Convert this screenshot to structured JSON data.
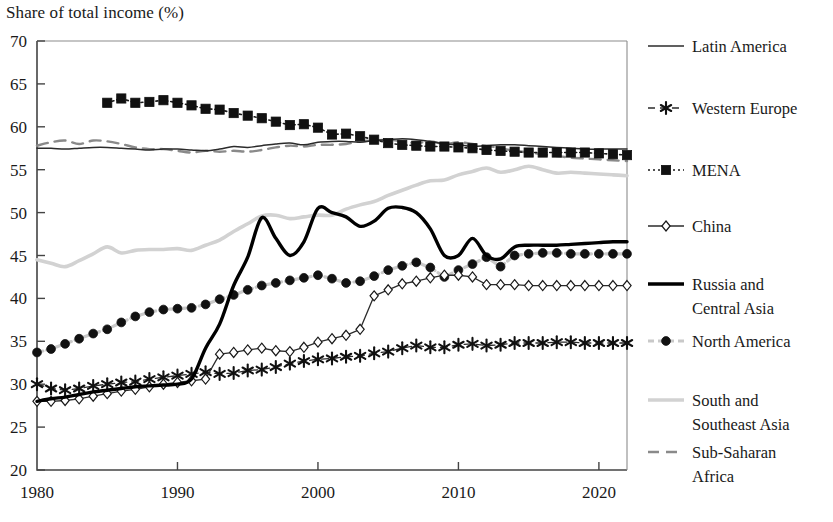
{
  "title": "Share of total income (%)",
  "axes": {
    "y_label": "Share of total income (%)",
    "y_ticks": [
      "70",
      "65",
      "60",
      "55",
      "50",
      "45",
      "40",
      "35",
      "30",
      "25",
      "20"
    ],
    "x_ticks": [
      "1980",
      "1990",
      "2000",
      "2010",
      "2020"
    ],
    "ylim": [
      20,
      70
    ],
    "xlim": [
      1980,
      2022
    ]
  },
  "legend": {
    "position": "right",
    "items": [
      {
        "label": "Latin America",
        "key": "latin_america",
        "style": "solid-thin",
        "color": "#2b2b2b",
        "marker": "none"
      },
      {
        "label": "Western Europe",
        "key": "western_europe",
        "style": "dashed",
        "color": "#2b2b2b",
        "marker": "star"
      },
      {
        "label": "MENA",
        "key": "mena",
        "style": "dotted",
        "color": "#1a1a1a",
        "marker": "square"
      },
      {
        "label": "China",
        "key": "china",
        "style": "solid-thin",
        "color": "#2b2b2b",
        "marker": "diamond-open"
      },
      {
        "label": "Russia and Central Asia",
        "key": "russia_central_asia",
        "style": "solid-thick",
        "color": "#000000",
        "marker": "none"
      },
      {
        "label": "North America",
        "key": "north_america",
        "style": "dashed-gray",
        "color": "#c8c8c8",
        "marker": "circle"
      },
      {
        "label": "South and Southeast Asia",
        "key": "south_southeast_asia",
        "style": "solid-thick-gray",
        "color": "#d2d2d2",
        "marker": "none"
      },
      {
        "label": "Sub-Saharan Africa",
        "key": "sub_saharan_africa",
        "style": "dashed-mid",
        "color": "#8a8a8a",
        "marker": "none"
      }
    ]
  },
  "chart_data": {
    "type": "line",
    "title": "Share of total income (%)",
    "xlabel": "",
    "ylabel": "Share of total income (%)",
    "xlim": [
      1980,
      2022
    ],
    "ylim": [
      20,
      70
    ],
    "grid": false,
    "legend_position": "right",
    "x": [
      1980,
      1981,
      1982,
      1983,
      1984,
      1985,
      1986,
      1987,
      1988,
      1989,
      1990,
      1991,
      1992,
      1993,
      1994,
      1995,
      1996,
      1997,
      1998,
      1999,
      2000,
      2001,
      2002,
      2003,
      2004,
      2005,
      2006,
      2007,
      2008,
      2009,
      2010,
      2011,
      2012,
      2013,
      2014,
      2015,
      2016,
      2017,
      2018,
      2019,
      2020,
      2021,
      2022
    ],
    "series": [
      {
        "name": "Latin America",
        "values": [
          57.5,
          57.5,
          57.4,
          57.5,
          57.6,
          57.6,
          57.5,
          57.4,
          57.3,
          57.4,
          57.4,
          57.3,
          57.2,
          57.4,
          57.7,
          57.6,
          57.8,
          58.0,
          58.1,
          57.9,
          58.2,
          58.3,
          58.3,
          58.2,
          58.4,
          58.5,
          58.6,
          58.5,
          58.3,
          58.0,
          57.9,
          57.7,
          57.8,
          57.9,
          57.9,
          57.8,
          57.7,
          57.6,
          57.5,
          57.4,
          57.4,
          57.4,
          57.4
        ]
      },
      {
        "name": "Western Europe",
        "values": [
          30.0,
          29.5,
          29.3,
          29.5,
          29.8,
          30.0,
          30.2,
          30.3,
          30.6,
          30.8,
          31.0,
          31.2,
          31.4,
          31.2,
          31.3,
          31.6,
          31.7,
          32.0,
          32.4,
          32.7,
          32.9,
          33.0,
          33.2,
          33.3,
          33.6,
          33.8,
          34.2,
          34.5,
          34.3,
          34.3,
          34.6,
          34.7,
          34.5,
          34.6,
          34.8,
          34.8,
          34.8,
          34.9,
          34.9,
          34.8,
          34.8,
          34.8,
          34.8
        ]
      },
      {
        "name": "MENA",
        "values": [
          null,
          null,
          null,
          null,
          null,
          62.8,
          63.3,
          62.8,
          62.9,
          63.1,
          62.8,
          62.5,
          62.1,
          62.0,
          61.6,
          61.3,
          61.0,
          60.6,
          60.2,
          60.3,
          59.9,
          59.1,
          59.2,
          58.9,
          58.5,
          58.1,
          57.9,
          57.8,
          57.7,
          57.7,
          57.6,
          57.5,
          57.3,
          57.2,
          57.1,
          57.0,
          57.0,
          57.0,
          57.0,
          57.0,
          56.9,
          56.8,
          56.7
        ]
      },
      {
        "name": "China",
        "values": [
          28.0,
          28.0,
          28.1,
          28.3,
          28.6,
          28.9,
          29.2,
          29.4,
          29.7,
          30.0,
          30.2,
          30.4,
          30.6,
          33.5,
          33.7,
          34.0,
          34.2,
          33.9,
          33.8,
          34.3,
          34.9,
          35.3,
          35.7,
          36.4,
          40.3,
          41.0,
          41.7,
          42.0,
          42.4,
          42.7,
          42.7,
          42.5,
          41.6,
          41.6,
          41.6,
          41.5,
          41.5,
          41.5,
          41.5,
          41.5,
          41.5,
          41.5,
          41.5
        ]
      },
      {
        "name": "Russia and Central Asia",
        "values": [
          28.0,
          28.3,
          28.5,
          28.8,
          29.1,
          29.3,
          29.5,
          29.7,
          29.8,
          29.9,
          30.0,
          30.6,
          34.2,
          37.0,
          41.5,
          44.8,
          49.4,
          47.0,
          45.0,
          46.6,
          50.5,
          50.0,
          49.5,
          48.4,
          49.0,
          50.5,
          50.6,
          50.0,
          48.1,
          45.0,
          45.0,
          47.0,
          45.0,
          44.6,
          46.0,
          46.2,
          46.2,
          46.2,
          46.3,
          46.4,
          46.5,
          46.6,
          46.6
        ]
      },
      {
        "name": "North America",
        "values": [
          33.7,
          34.1,
          34.7,
          35.3,
          35.9,
          36.4,
          37.2,
          37.9,
          38.4,
          38.7,
          38.8,
          38.9,
          39.3,
          39.9,
          40.4,
          41.0,
          41.5,
          41.8,
          42.1,
          42.4,
          42.7,
          42.3,
          41.8,
          42.0,
          42.6,
          43.3,
          43.8,
          44.2,
          43.6,
          42.5,
          43.3,
          44.0,
          44.8,
          43.7,
          45.0,
          45.2,
          45.3,
          45.3,
          45.2,
          45.2,
          45.2,
          45.2,
          45.2
        ]
      },
      {
        "name": "South and Southeast Asia",
        "values": [
          44.5,
          44.1,
          43.7,
          44.4,
          45.2,
          46.0,
          45.3,
          45.6,
          45.7,
          45.7,
          45.8,
          45.6,
          46.2,
          46.8,
          47.8,
          48.7,
          49.6,
          49.7,
          49.3,
          49.5,
          49.7,
          49.7,
          50.4,
          50.9,
          51.3,
          52.0,
          52.6,
          53.2,
          53.7,
          53.8,
          54.4,
          54.8,
          55.2,
          54.7,
          55.0,
          55.4,
          55.0,
          54.6,
          54.7,
          54.6,
          54.5,
          54.4,
          54.3
        ]
      },
      {
        "name": "Sub-Saharan Africa",
        "values": [
          57.8,
          58.2,
          58.4,
          58.0,
          58.4,
          58.3,
          58.0,
          57.6,
          57.4,
          57.4,
          57.2,
          57.0,
          57.2,
          57.1,
          57.2,
          57.1,
          57.3,
          57.6,
          57.8,
          57.7,
          57.9,
          57.9,
          58.0,
          58.3,
          58.4,
          58.5,
          58.3,
          58.1,
          58.3,
          58.0,
          58.2,
          58.0,
          57.8,
          57.5,
          57.2,
          57.0,
          56.8,
          56.6,
          56.4,
          56.3,
          56.2,
          56.1,
          56.0
        ]
      }
    ]
  }
}
